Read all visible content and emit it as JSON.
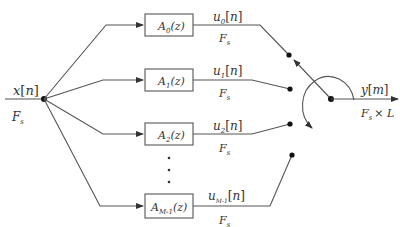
{
  "input": {
    "signal": "x[n]",
    "rate": "F_s",
    "signal_main": "x",
    "signal_idx": "n",
    "rate_main": "F",
    "rate_sub": "s"
  },
  "branches": [
    {
      "filter_main": "A",
      "filter_sub": "0",
      "filter_arg": "(z)",
      "out_main": "u",
      "out_sub": "0",
      "out_idx": "n",
      "rate_main": "F",
      "rate_sub": "s"
    },
    {
      "filter_main": "A",
      "filter_sub": "1",
      "filter_arg": "(z)",
      "out_main": "u",
      "out_sub": "1",
      "out_idx": "n",
      "rate_main": "F",
      "rate_sub": "s"
    },
    {
      "filter_main": "A",
      "filter_sub": "2",
      "filter_arg": "(z)",
      "out_main": "u",
      "out_sub": "2",
      "out_idx": "n",
      "rate_main": "F",
      "rate_sub": "s"
    },
    {
      "filter_main": "A",
      "filter_sub": "M-1",
      "filter_arg": "(z)",
      "out_main": "u",
      "out_sub": "M-1",
      "out_idx": "n",
      "rate_main": "F",
      "rate_sub": "s"
    }
  ],
  "ellipsis": "⋮",
  "output": {
    "signal_main": "y",
    "signal_idx": "m",
    "rate_main": "F",
    "rate_sub": "s",
    "rate_mult": "× L"
  },
  "colors": {
    "line": "#555555",
    "text": "#333333",
    "dot": "#111111"
  }
}
